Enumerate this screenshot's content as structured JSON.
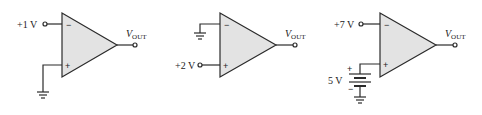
{
  "colors": {
    "line": "#2b2b2b",
    "triangle_fill": "#e3e3e3",
    "background": "#ffffff"
  },
  "circuits": [
    {
      "id": "circuit-1",
      "inverting_input": {
        "label": "+1 V",
        "type": "source"
      },
      "noninverting_input": {
        "label": "",
        "type": "ground"
      },
      "output_label": {
        "main": "V",
        "sub": "OUT"
      },
      "minus_sign": "−",
      "plus_sign": "+"
    },
    {
      "id": "circuit-2",
      "inverting_input": {
        "label": "",
        "type": "ground"
      },
      "noninverting_input": {
        "label": "+2 V",
        "type": "source"
      },
      "output_label": {
        "main": "V",
        "sub": "OUT"
      },
      "minus_sign": "−",
      "plus_sign": "+"
    },
    {
      "id": "circuit-3",
      "inverting_input": {
        "label": "+7 V",
        "type": "source"
      },
      "noninverting_input": {
        "label": "5 V",
        "type": "battery",
        "battery_plus": "+",
        "battery_minus": "−"
      },
      "output_label": {
        "main": "V",
        "sub": "OUT"
      },
      "minus_sign": "−",
      "plus_sign": "+"
    }
  ]
}
